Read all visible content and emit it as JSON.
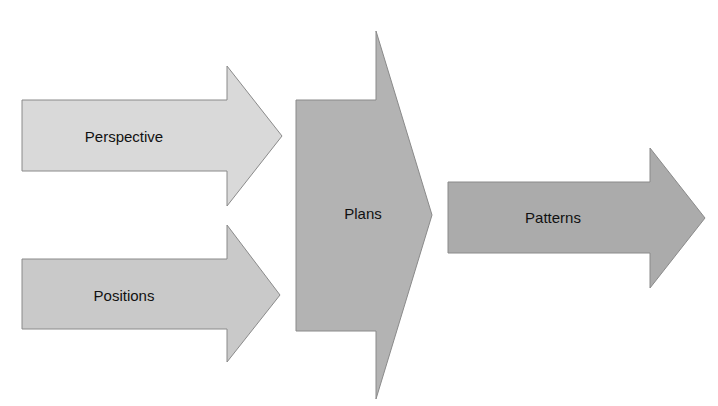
{
  "diagram": {
    "type": "flow-arrows",
    "nodes": [
      {
        "id": "perspective",
        "label": "Perspective",
        "color": "#d9d9d9"
      },
      {
        "id": "positions",
        "label": "Positions",
        "color": "#c9c9c9"
      },
      {
        "id": "plans",
        "label": "Plans",
        "color": "#b3b3b3"
      },
      {
        "id": "patterns",
        "label": "Patterns",
        "color": "#ababab"
      }
    ],
    "edges": [
      {
        "from": "perspective",
        "to": "plans"
      },
      {
        "from": "positions",
        "to": "plans"
      },
      {
        "from": "plans",
        "to": "patterns"
      }
    ]
  }
}
